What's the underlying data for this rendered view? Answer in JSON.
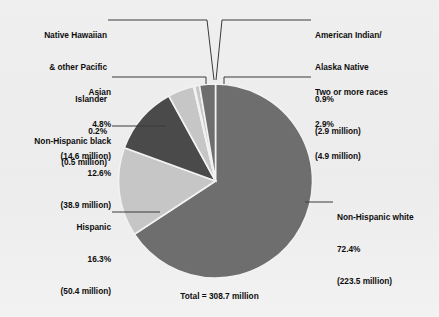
{
  "chart_data": {
    "type": "pie",
    "title": "",
    "total_label": "Total = 308.7 million",
    "total_value": 308.7,
    "units": "million",
    "legend_position": "callout-labels",
    "categories": [
      "Non-Hispanic white",
      "Hispanic",
      "Non-Hispanic black",
      "Asian",
      "Native Hawaiian & other Pacific Islander",
      "American Indian/Alaska Native",
      "Two or more races"
    ],
    "values": [
      72.4,
      16.3,
      12.6,
      4.8,
      0.2,
      0.9,
      2.9
    ],
    "counts_millions": [
      223.5,
      50.4,
      38.9,
      14.6,
      0.5,
      2.9,
      4.9
    ],
    "slice_colors": [
      "#6e6e6e",
      "#c6c6c6",
      "#4a4a4a",
      "#c6c6c6",
      "#9a9a9a",
      "#c6c6c6",
      "#6e6e6e"
    ],
    "start_angle_deg": 0,
    "direction": "clockwise",
    "slices": [
      {
        "name": "Non-Hispanic white",
        "percent": "72.4%",
        "count": "(223.5 million)",
        "value": 72.4,
        "color": "#6e6e6e"
      },
      {
        "name": "Hispanic",
        "percent": "16.3%",
        "count": "(50.4 million)",
        "value": 16.3,
        "color": "#c6c6c6"
      },
      {
        "name": "Non-Hispanic black",
        "percent": "12.6%",
        "count": "(38.9 million)",
        "value": 12.6,
        "color": "#4a4a4a"
      },
      {
        "name": "Asian",
        "percent": "4.8%",
        "count": "(14.6 million)",
        "value": 4.8,
        "color": "#c6c6c6"
      },
      {
        "name_line1": "Native Hawaiian",
        "name_line2": "& other Pacific",
        "name_line3": "Islander",
        "percent": "0.2%",
        "count": "(0.5 million)",
        "value": 0.2,
        "color": "#9a9a9a"
      },
      {
        "name_line1": "American Indian/",
        "name_line2": "Alaska Native",
        "percent": "0.9%",
        "count": "(2.9 million)",
        "value": 0.9,
        "color": "#c6c6c6"
      },
      {
        "name": "Two or more races",
        "percent": "2.9%",
        "count": "(4.9 million)",
        "value": 2.9,
        "color": "#6e6e6e"
      }
    ]
  },
  "labels": {
    "nhpi": {
      "l1": "Native Hawaiian",
      "l2": "& other Pacific",
      "l3": "Islander",
      "l4": "0.2%",
      "l5": "(0.5 million)"
    },
    "asian": {
      "l1": "Asian",
      "l2": "4.8%",
      "l3": "(14.6 million)"
    },
    "nh_black": {
      "l1": "Non-Hispanic black",
      "l2": "12.6%",
      "l3": "(38.9 million)"
    },
    "hispanic": {
      "l1": "Hispanic",
      "l2": "16.3%",
      "l3": "(50.4 million)"
    },
    "aian": {
      "l1": "American Indian/",
      "l2": "Alaska Native",
      "l3": "0.9%",
      "l4": "(2.9 million)"
    },
    "two_or_more": {
      "l1": "Two or more races",
      "l2": "2.9%",
      "l3": "(4.9 million)"
    },
    "nh_white": {
      "l1": "Non-Hispanic white",
      "l2": "72.4%",
      "l3": "(223.5 million)"
    }
  },
  "total": {
    "text": "Total = 308.7 million"
  },
  "colors": {
    "background": "#ececec",
    "text": "#0d0d0d",
    "leader_line": "#3a3a3a",
    "slice_separator": "#f2f2f2"
  }
}
